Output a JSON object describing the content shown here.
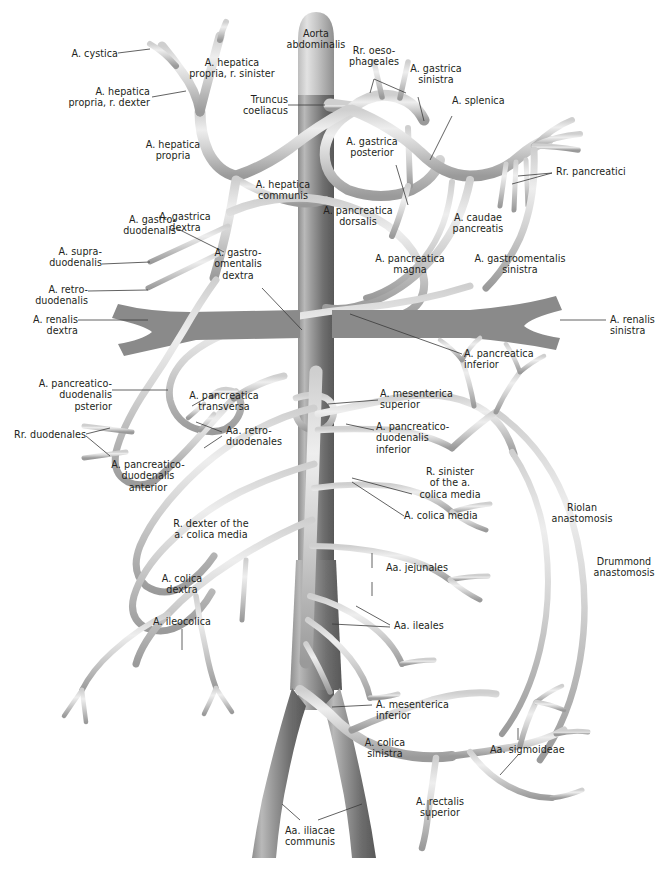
{
  "figure": {
    "background_color": "#ffffff",
    "vessel_light_color": "#d8d8d8",
    "vessel_mid_color": "#b4b4b4",
    "vessel_dark_color": "#7d7d7d",
    "aorta_color": "#8d8d8d",
    "label_color": "#231f20",
    "leader_color": "#3a3a3a"
  },
  "labels": [
    {
      "id": "aorta-abdominalis",
      "text": "Aorta\nabdominalis"
    },
    {
      "id": "a-cystica",
      "text": "A. cystica"
    },
    {
      "id": "a-hepatica-propria-r-sinister",
      "text": "A. hepatica\npropria, r. sinister"
    },
    {
      "id": "a-hepatica-propria-r-dexter",
      "text": "A. hepatica\npropria, r. dexter"
    },
    {
      "id": "truncus-coeliacus",
      "text": "Truncus\ncoeliacus"
    },
    {
      "id": "rr-oesophageales",
      "text": "Rr. oeso-\nphageales"
    },
    {
      "id": "a-gastrica-sinistra",
      "text": "A. gastrica\nsinistra"
    },
    {
      "id": "a-splenica",
      "text": "A. splenica"
    },
    {
      "id": "a-hepatica-propria",
      "text": "A. hepatica\npropria"
    },
    {
      "id": "a-gastrica-posterior",
      "text": "A. gastrica\nposterior"
    },
    {
      "id": "rr-pancreatici",
      "text": "Rr. pancreatici"
    },
    {
      "id": "a-hepatica-communis",
      "text": "A. hepatica\ncommunis"
    },
    {
      "id": "a-gastrica-dextra",
      "text": "A. gastrica\ndextra"
    },
    {
      "id": "a-pancreatica-dorsalis",
      "text": "A. pancreatica\ndorsalis"
    },
    {
      "id": "a-caudae-pancreatis",
      "text": "A. caudae\npancreatis"
    },
    {
      "id": "a-gastroduodenalis",
      "text": "A. gastro-\nduodenalis"
    },
    {
      "id": "a-pancreatica-magna",
      "text": "A. pancreatica\nmagna"
    },
    {
      "id": "a-gastroomentalis-sinistra",
      "text": "A. gastroomentalis\nsinistra"
    },
    {
      "id": "a-supraduodenalis",
      "text": "A. supra-\nduodenalis"
    },
    {
      "id": "a-gastroomentalis-dextra",
      "text": "A. gastro-\nomentalis\ndextra"
    },
    {
      "id": "a-retroduodenalis",
      "text": "A. retro-\nduodenalis"
    },
    {
      "id": "a-renalis-dextra",
      "text": "A. renalis\ndextra"
    },
    {
      "id": "a-renalis-sinistra",
      "text": "A. renalis\nsinistra"
    },
    {
      "id": "a-pancreatica-inferior",
      "text": "A. pancreatica\ninferior"
    },
    {
      "id": "a-pancreaticoduodenalis-posterior",
      "text": "A. pancreatico-\nduodenalis\npsterior"
    },
    {
      "id": "a-pancreatica-transversa",
      "text": "A. pancreatica\ntransversa"
    },
    {
      "id": "a-mesenterica-superior",
      "text": "A. mesenterica\nsuperior"
    },
    {
      "id": "aa-retroduodenales",
      "text": "Aa. retro-\nduodenales"
    },
    {
      "id": "a-pancreaticoduodenalis-inferior",
      "text": "A. pancreatico-\nduodenalis\ninferior"
    },
    {
      "id": "rr-duodenales",
      "text": "Rr. duodenales"
    },
    {
      "id": "a-pancreaticoduodenalis-anterior",
      "text": "A. pancreatico-\nduodenalis\nanterior"
    },
    {
      "id": "r-sinister-a-colica-media",
      "text": "R. sinister\nof the a.\ncolica media"
    },
    {
      "id": "riolan-anastomosis",
      "text": "Riolan\nanastomosis"
    },
    {
      "id": "r-dexter-a-colica-media",
      "text": "R. dexter of the\na. colica media"
    },
    {
      "id": "a-colica-media",
      "text": "A. colica media"
    },
    {
      "id": "drummond-anastomosis",
      "text": "Drummond\nanastomosis"
    },
    {
      "id": "aa-jejunales",
      "text": "Aa. jejunales"
    },
    {
      "id": "a-colica-dextra",
      "text": "A. colica\ndextra"
    },
    {
      "id": "a-ileocolica",
      "text": "A. ileocolica"
    },
    {
      "id": "aa-ileales",
      "text": "Aa. ileales"
    },
    {
      "id": "a-mesenterica-inferior",
      "text": "A. mesenterica\ninferior"
    },
    {
      "id": "a-colica-sinistra",
      "text": "A. colica\nsinistra"
    },
    {
      "id": "aa-sigmoideae",
      "text": "Aa. sigmoideae"
    },
    {
      "id": "a-rectalis-superior",
      "text": "A. rectalis\nsuperior"
    },
    {
      "id": "aa-iliacae-communis",
      "text": "Aa. iliacae\ncommunis"
    }
  ]
}
